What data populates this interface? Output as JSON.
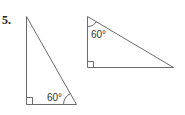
{
  "problem": {
    "number": "5.",
    "triangles": [
      {
        "name": "left-triangle",
        "angle_label": "60°",
        "right_angle": "bottom-left",
        "angle_vertex": "bottom-right"
      },
      {
        "name": "right-triangle",
        "angle_label": "60°",
        "right_angle": "bottom-left",
        "angle_vertex": "top-left"
      }
    ]
  },
  "colors": {
    "stroke": "#6b6b6b",
    "text": "#333333"
  }
}
